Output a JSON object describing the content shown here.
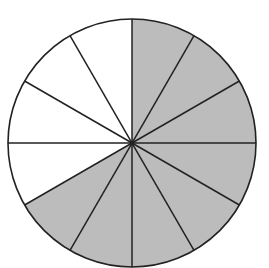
{
  "diagram": {
    "type": "fraction-circle",
    "total_sectors": 12,
    "shaded_sectors": 8,
    "shaded_sector_indices_clockwise_from_top": [
      0,
      1,
      2,
      3,
      4,
      5,
      6,
      7
    ],
    "colors": {
      "shaded": "#bcbcbc",
      "unshaded": "#ffffff",
      "stroke": "#222222",
      "background": "#ffffff"
    },
    "geometry": {
      "cx": 132,
      "cy": 143,
      "r": 124
    }
  }
}
